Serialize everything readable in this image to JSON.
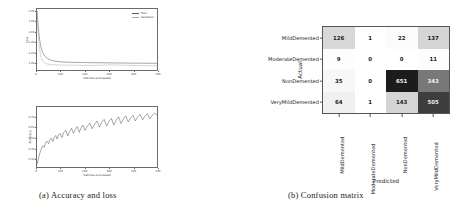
{
  "figure": {
    "subfigures": [
      {
        "caption": "(a) Accuracy and loss"
      },
      {
        "caption": "(b) Confusion matrix"
      }
    ]
  },
  "chart_data": [
    {
      "type": "line",
      "title": "",
      "xlabel": "batches processed",
      "ylabel": "Loss",
      "xlim": [
        0,
        500
      ],
      "ylim": [
        0.85,
        2.05
      ],
      "xticks": [
        "0",
        "100",
        "200",
        "300",
        "400",
        "500"
      ],
      "yticks": [
        "1.00",
        "1.20",
        "1.40",
        "1.60",
        "1.80",
        "2.00"
      ],
      "grid": false,
      "legend_position": "upper right",
      "series": [
        {
          "name": "Train",
          "color": "#5b5b5b",
          "x": [
            0,
            5,
            10,
            15,
            20,
            25,
            30,
            40,
            50,
            65,
            80,
            100,
            120,
            150,
            180,
            210,
            240,
            270,
            300,
            330,
            360,
            390,
            420,
            450,
            480,
            500
          ],
          "values": [
            2.02,
            1.72,
            1.48,
            1.33,
            1.24,
            1.18,
            1.14,
            1.09,
            1.06,
            1.035,
            1.02,
            1.01,
            1.005,
            1.0,
            0.998,
            0.995,
            0.993,
            0.992,
            0.99,
            0.988,
            0.987,
            0.985,
            0.984,
            0.983,
            0.982,
            0.981
          ]
        },
        {
          "name": "Validation",
          "color": "#a8a8a8",
          "x": [
            0,
            5,
            10,
            15,
            20,
            25,
            30,
            40,
            50,
            65,
            80,
            100,
            120,
            150,
            180,
            210,
            240,
            270,
            300,
            330,
            360,
            390,
            420,
            450,
            480,
            500
          ],
          "values": [
            1.98,
            1.55,
            1.28,
            1.14,
            1.06,
            1.02,
            0.995,
            0.972,
            0.962,
            0.955,
            0.951,
            0.948,
            0.946,
            0.944,
            0.942,
            0.941,
            0.94,
            0.943,
            0.952,
            0.948,
            0.944,
            0.941,
            0.938,
            0.936,
            0.934,
            0.933
          ]
        }
      ]
    },
    {
      "type": "line",
      "title": "",
      "xlabel": "batches processed",
      "ylabel": "Accuracy",
      "xlim": [
        0,
        500
      ],
      "ylim": [
        0.22,
        0.8
      ],
      "xticks": [
        "0",
        "100",
        "200",
        "300",
        "400",
        "500"
      ],
      "yticks": [
        "0.30",
        "0.40",
        "0.50",
        "0.60",
        "0.70"
      ],
      "grid": false,
      "series": [
        {
          "name": "Accuracy",
          "color": "#4a4a4a",
          "x": [
            0,
            6,
            12,
            18,
            24,
            30,
            36,
            42,
            48,
            54,
            60,
            66,
            72,
            78,
            84,
            90,
            96,
            104,
            112,
            120,
            128,
            136,
            144,
            152,
            160,
            168,
            176,
            184,
            192,
            200,
            210,
            220,
            230,
            240,
            250,
            260,
            270,
            280,
            290,
            300,
            310,
            320,
            330,
            340,
            350,
            360,
            370,
            380,
            390,
            400,
            410,
            420,
            430,
            440,
            450,
            460,
            470,
            480,
            490,
            500
          ],
          "values": [
            0.245,
            0.3,
            0.355,
            0.395,
            0.425,
            0.41,
            0.455,
            0.47,
            0.445,
            0.485,
            0.5,
            0.465,
            0.505,
            0.525,
            0.49,
            0.53,
            0.545,
            0.505,
            0.555,
            0.575,
            0.52,
            0.565,
            0.595,
            0.545,
            0.585,
            0.61,
            0.555,
            0.6,
            0.625,
            0.575,
            0.615,
            0.645,
            0.59,
            0.635,
            0.665,
            0.605,
            0.655,
            0.68,
            0.615,
            0.66,
            0.69,
            0.625,
            0.675,
            0.705,
            0.64,
            0.685,
            0.715,
            0.655,
            0.695,
            0.72,
            0.665,
            0.705,
            0.73,
            0.675,
            0.715,
            0.735,
            0.685,
            0.72,
            0.74,
            0.725
          ]
        }
      ]
    },
    {
      "type": "heatmap",
      "title": "Confusion matrix",
      "xlabel": "Predicted",
      "ylabel": "Actual",
      "row_labels": [
        "MildDemented",
        "ModerateDemented",
        "NonDemented",
        "VeryMildDemented"
      ],
      "col_labels": [
        "MildDemented",
        "ModerateDemented",
        "NonDemented",
        "VeryMildDemented"
      ],
      "values": [
        [
          126,
          1,
          22,
          137
        ],
        [
          9,
          0,
          0,
          11
        ],
        [
          35,
          0,
          651,
          343
        ],
        [
          64,
          1,
          143,
          505
        ]
      ],
      "cell_colors": [
        [
          "#d8d8d8",
          "#ffffff",
          "#fbfbfb",
          "#d5d5d5"
        ],
        [
          "#fdfdfd",
          "#ffffff",
          "#ffffff",
          "#fdfdfd"
        ],
        [
          "#f7f7f7",
          "#ffffff",
          "#1c1c1c",
          "#787878"
        ],
        [
          "#f0f0f0",
          "#ffffff",
          "#d4d4d4",
          "#3e3e3e"
        ]
      ],
      "cell_text_colors": [
        [
          "#1a1a1a",
          "#1a1a1a",
          "#1a1a1a",
          "#1a1a1a"
        ],
        [
          "#1a1a1a",
          "#1a1a1a",
          "#1a1a1a",
          "#1a1a1a"
        ],
        [
          "#1a1a1a",
          "#1a1a1a",
          "#f2f2f2",
          "#f2f2f2"
        ],
        [
          "#1a1a1a",
          "#1a1a1a",
          "#1a1a1a",
          "#f2f2f2"
        ]
      ]
    }
  ]
}
